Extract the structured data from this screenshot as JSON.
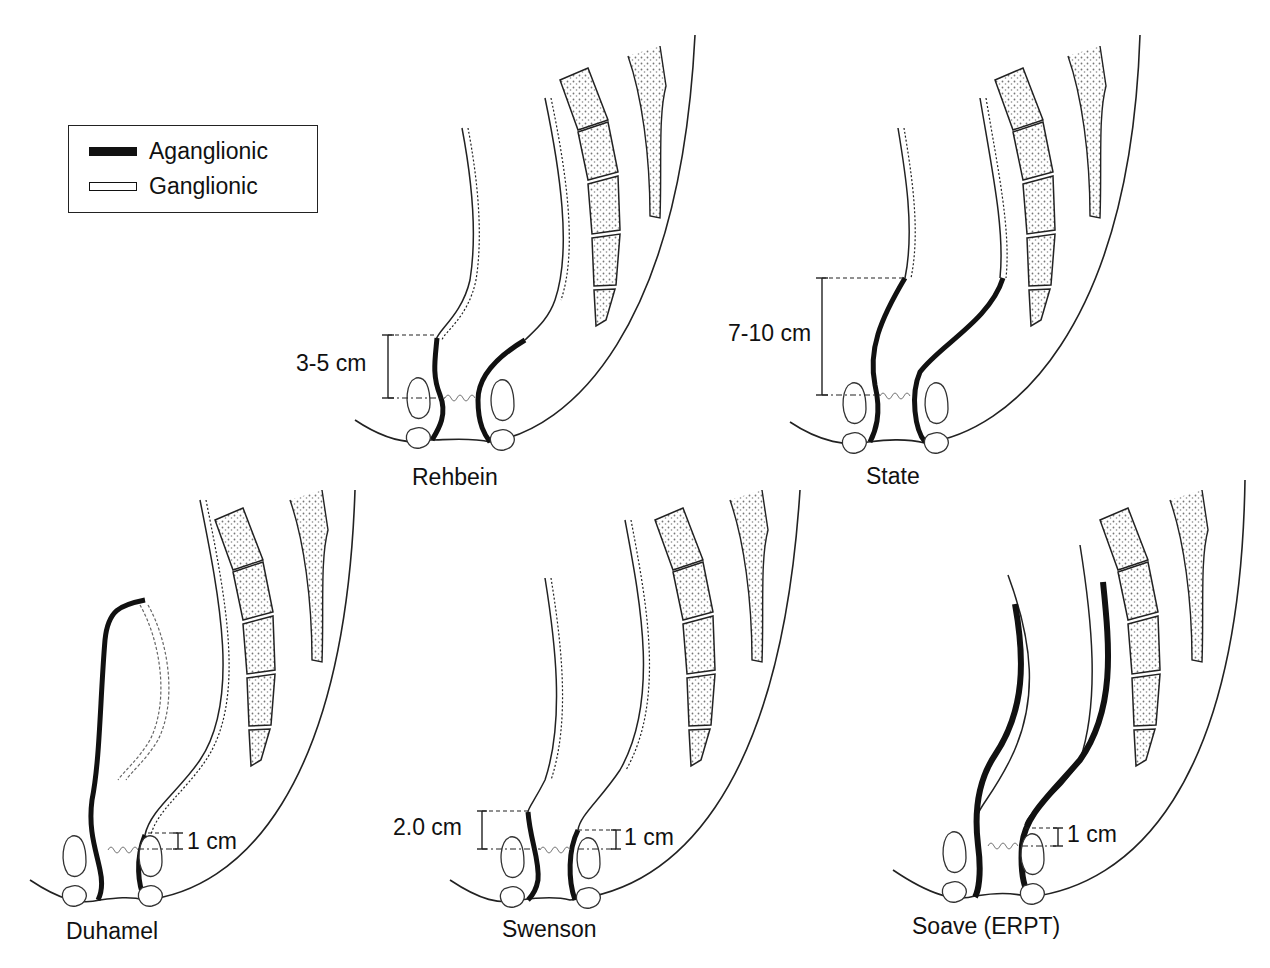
{
  "legend": {
    "items": [
      {
        "label": "Aganglionic",
        "swatch": "filled-black"
      },
      {
        "label": "Ganglionic",
        "swatch": "outline-white"
      }
    ]
  },
  "colors": {
    "aganglionic": "#111111",
    "ganglionic": "#ffffff",
    "line": "#222222",
    "bone_stipple": "#777777"
  },
  "panels": [
    {
      "id": "rehbein",
      "title": "Rehbein",
      "measure": "3-5 cm",
      "measure_small": null
    },
    {
      "id": "state",
      "title": "State",
      "measure": "7-10 cm",
      "measure_small": null
    },
    {
      "id": "duhamel",
      "title": "Duhamel",
      "measure": null,
      "measure_small": "1 cm"
    },
    {
      "id": "swenson",
      "title": "Swenson",
      "measure": "2.0 cm",
      "measure_small": "1 cm"
    },
    {
      "id": "soave",
      "title": "Soave (ERPT)",
      "measure": null,
      "measure_small": "1 cm"
    }
  ]
}
